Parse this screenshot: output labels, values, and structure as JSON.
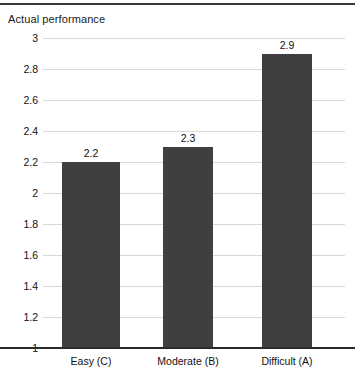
{
  "chart_data": {
    "type": "bar",
    "title": "Actual performance",
    "xlabel": "",
    "ylabel": "",
    "categories": [
      "Easy (C)",
      "Moderate (B)",
      "Difficult (A)"
    ],
    "values": [
      2.2,
      2.3,
      2.9
    ],
    "value_labels": [
      "2.2",
      "2.3",
      "2.9"
    ],
    "ylim": [
      1,
      3
    ],
    "ytick_step": 0.2,
    "ytick_labels": [
      "3",
      "2.8",
      "2.6",
      "2.4",
      "2.2",
      "2",
      "1.8",
      "1.6",
      "1.4",
      "1.2",
      "1"
    ],
    "ytick_values": [
      3,
      2.8,
      2.6,
      2.4,
      2.2,
      2,
      1.8,
      1.6,
      1.4,
      1.2,
      1
    ],
    "grid": true,
    "legend": false,
    "legend_position": "none",
    "bar_color": "#3f3f3f",
    "grid_color": "#d8d8d8",
    "axis_color": "#2b2b2b",
    "background_color": "#ffffff"
  }
}
